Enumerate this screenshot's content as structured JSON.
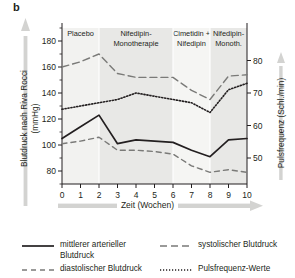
{
  "panel": {
    "letter": "b"
  },
  "axes": {
    "y_left": {
      "title": "Blutdruck nach Riva Rocci\n(mmHg)",
      "ticks": [
        80,
        100,
        120,
        140,
        160,
        180
      ],
      "min": 70,
      "max": 190,
      "arrow_icon": "up-arrow-icon"
    },
    "y_right": {
      "title": "Pulsfrequenz (Schl./min)",
      "ticks": [
        50,
        60,
        70,
        80
      ],
      "min": 42,
      "max": 90,
      "arrow_icon": "up-arrow-icon"
    },
    "x": {
      "title": "Zeit (Wochen)",
      "ticks": [
        0,
        1,
        2,
        3,
        4,
        5,
        6,
        7,
        8,
        9,
        10
      ],
      "min": 0,
      "max": 10,
      "arrow_icon": "right-arrow-icon"
    }
  },
  "bands": [
    {
      "label": "Placebo",
      "from": 0,
      "to": 2,
      "shade": "#f2f2f0"
    },
    {
      "label": "Nifedipin-\nMonotherapie",
      "from": 2,
      "to": 6,
      "shade": "#e8e8e6"
    },
    {
      "label": "Cimetidin +\nNifedipin",
      "from": 6,
      "to": 8,
      "shade": "#f5f5f3"
    },
    {
      "label": "Nifedipin-\nMonoth.",
      "from": 8,
      "to": 10,
      "shade": "#e8e8e6"
    }
  ],
  "chart_data": {
    "type": "line",
    "title": "",
    "xlabel": "Zeit (Wochen)",
    "ylabel": "Blutdruck nach Riva Rocci (mmHg)",
    "ylabel_secondary": "Pulsfrequenz (Schl./min)",
    "xlim": [
      0,
      10
    ],
    "ylim": [
      70,
      190
    ],
    "ylim_secondary": [
      42,
      90
    ],
    "grid": false,
    "legend_position": "bottom",
    "x": [
      0,
      1,
      2,
      3,
      4,
      5,
      6,
      7,
      8,
      9,
      10
    ],
    "series": [
      {
        "name": "mittlerer arterieller Blutdruck",
        "style": "solid",
        "axis": "left",
        "color": "#231f20",
        "values": [
          105,
          114,
          123,
          101,
          104,
          103,
          102,
          96,
          91,
          104,
          105
        ]
      },
      {
        "name": "systolischer Blutdruck",
        "style": "dashed-long",
        "axis": "left",
        "color": "#7a7a78",
        "values": [
          160,
          164,
          170,
          155,
          152,
          152,
          152,
          142,
          135,
          153,
          154
        ]
      },
      {
        "name": "diastolischer Blutdruck",
        "style": "dashed-medium",
        "axis": "left",
        "color": "#7a7a78",
        "values": [
          101,
          103,
          106,
          96,
          96,
          95,
          93,
          84,
          79,
          81,
          79
        ]
      },
      {
        "name": "Pulsfrequenz-Werte",
        "style": "dotted",
        "axis": "right",
        "color": "#231f20",
        "values": [
          65,
          66,
          67,
          68,
          70,
          69,
          68,
          67,
          64,
          71,
          73
        ]
      }
    ]
  },
  "legend": [
    {
      "label": "mittlerer arterieller\nBlutdruck",
      "style": "solid",
      "color": "#231f20"
    },
    {
      "label": "systolischer Blutdruck",
      "style": "dashed-long",
      "color": "#7a7a78"
    },
    {
      "label": "diastolischer Blutdruck",
      "style": "dashed-medium",
      "color": "#7a7a78"
    },
    {
      "label": "Pulsfrequenz-Werte",
      "style": "dotted",
      "color": "#231f20"
    }
  ]
}
